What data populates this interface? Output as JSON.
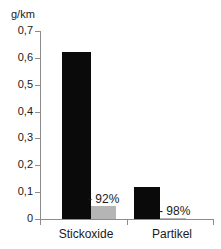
{
  "chart_data": {
    "type": "bar",
    "title": "",
    "xlabel": "",
    "ylabel": "g/km",
    "unit_label": "g/km",
    "categories": [
      "Stickoxide",
      "Partikel"
    ],
    "ylim": [
      0,
      0.7
    ],
    "ytick_labels": [
      "0,7",
      "0,6",
      "0,5",
      "0,4",
      "0,3",
      "0,2",
      "0,1",
      "0"
    ],
    "ytick_values": [
      0.7,
      0.6,
      0.5,
      0.4,
      0.3,
      0.2,
      0.1,
      0
    ],
    "grid": false,
    "legend": "none",
    "decimal_separator": ",",
    "series": [
      {
        "name": "dark",
        "color": "#0a0a0a",
        "values": [
          0.62,
          0.12
        ]
      },
      {
        "name": "light",
        "color": "#b5b5b5",
        "values": [
          0.05,
          0.003
        ]
      }
    ],
    "annotations": [
      {
        "text": "- 92%",
        "category": "Stickoxide"
      },
      {
        "text": "- 98%",
        "category": "Partikel"
      }
    ]
  },
  "axis": {
    "unit": "g/km",
    "ticks": [
      {
        "label": "0,7",
        "value": 0.7
      },
      {
        "label": "0,6",
        "value": 0.6
      },
      {
        "label": "0,5",
        "value": 0.5
      },
      {
        "label": "0,4",
        "value": 0.4
      },
      {
        "label": "0,3",
        "value": 0.3
      },
      {
        "label": "0,2",
        "value": 0.2
      },
      {
        "label": "0,1",
        "value": 0.1
      },
      {
        "label": "0",
        "value": 0
      }
    ]
  },
  "groups": [
    {
      "label": "Stickoxide",
      "dark_value": 0.62,
      "light_value": 0.05,
      "annotation": "- 92%"
    },
    {
      "label": "Partikel",
      "dark_value": 0.12,
      "light_value": 0.003,
      "annotation": "- 98%"
    }
  ],
  "colors": {
    "dark_bar": "#0a0a0a",
    "light_bar": "#b5b5b5",
    "axis": "#8c8c8c",
    "text": "#1a1a1a",
    "background": "#ffffff"
  }
}
